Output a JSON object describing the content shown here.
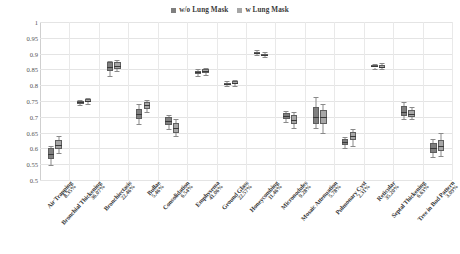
{
  "legend": {
    "position": "top-center",
    "entries": [
      {
        "label": "w/o Lung Mask",
        "color": "#7f7f7f"
      },
      {
        "label": "w Lung Mask",
        "color": "#a6a6a6"
      }
    ]
  },
  "axes": {
    "y": {
      "min": 0.5,
      "max": 1.0,
      "step": 0.05,
      "ticks": [
        "0.5",
        "0.55",
        "0.6",
        "0.65",
        "0.7",
        "0.75",
        "0.8",
        "0.85",
        "0.9",
        "0.95",
        "1"
      ],
      "label": "",
      "grid": true
    },
    "x": {
      "label": "",
      "grid": true
    }
  },
  "chart_data": {
    "type": "box",
    "title": "",
    "xlabel": "",
    "ylabel": "",
    "ylim": [
      0.5,
      1.0
    ],
    "ytick_step": 0.05,
    "grid": true,
    "legend_position": "top-center",
    "categories": [
      "Air Trapping",
      "Bronchial Thickening",
      "Bronchiectasis",
      "Bullae",
      "Consolidation",
      "Emphysema",
      "Ground Glass",
      "Honeycombing",
      "Micronodules",
      "Mosaic Attenuation",
      "Pulmonary Cyst",
      "Reticular",
      "Septal Thickening",
      "Tree in Bud Pattern"
    ],
    "category_percentages": [
      "8.35%",
      "36.07%",
      "22.46%",
      "5.46%",
      "6.54%",
      "41.06%",
      "22.57%",
      "11.46%",
      "9.28%",
      "5.78%",
      "2.31%",
      "35.20%",
      "6.63%",
      "3.09%"
    ],
    "series": [
      {
        "name": "w/o Lung Mask",
        "color": "#7f7f7f",
        "boxes": [
          {
            "category": "Air Trapping",
            "whisker_low": 0.548,
            "q1": 0.565,
            "median": 0.582,
            "q3": 0.6,
            "whisker_high": 0.607
          },
          {
            "category": "Bronchial Thickening",
            "whisker_low": 0.738,
            "q1": 0.742,
            "median": 0.746,
            "q3": 0.75,
            "whisker_high": 0.752
          },
          {
            "category": "Bronchiectasis",
            "whisker_low": 0.828,
            "q1": 0.845,
            "median": 0.858,
            "q3": 0.872,
            "whisker_high": 0.878
          },
          {
            "category": "Bullae",
            "whisker_low": 0.676,
            "q1": 0.694,
            "median": 0.71,
            "q3": 0.726,
            "whisker_high": 0.742
          },
          {
            "category": "Consolidation",
            "whisker_low": 0.66,
            "q1": 0.674,
            "median": 0.686,
            "q3": 0.698,
            "whisker_high": 0.706
          },
          {
            "category": "Emphysema",
            "whisker_low": 0.828,
            "q1": 0.836,
            "median": 0.841,
            "q3": 0.846,
            "whisker_high": 0.852
          },
          {
            "category": "Ground Glass",
            "whisker_low": 0.798,
            "q1": 0.801,
            "median": 0.804,
            "q3": 0.808,
            "whisker_high": 0.812
          },
          {
            "category": "Honeycombing",
            "whisker_low": 0.894,
            "q1": 0.898,
            "median": 0.902,
            "q3": 0.906,
            "whisker_high": 0.91
          },
          {
            "category": "Micronodules",
            "whisker_low": 0.684,
            "q1": 0.694,
            "median": 0.703,
            "q3": 0.712,
            "whisker_high": 0.718
          },
          {
            "category": "Mosaic Attenuation",
            "whisker_low": 0.664,
            "q1": 0.676,
            "median": 0.7,
            "q3": 0.73,
            "whisker_high": 0.762
          },
          {
            "category": "Pulmonary Cyst",
            "whisker_low": 0.602,
            "q1": 0.612,
            "median": 0.621,
            "q3": 0.63,
            "whisker_high": 0.636
          },
          {
            "category": "Reticular",
            "whisker_low": 0.85,
            "q1": 0.856,
            "median": 0.86,
            "q3": 0.864,
            "whisker_high": 0.868
          },
          {
            "category": "Septal Thickening",
            "whisker_low": 0.694,
            "q1": 0.702,
            "median": 0.716,
            "q3": 0.734,
            "whisker_high": 0.748
          },
          {
            "category": "Tree in Bud Pattern",
            "whisker_low": 0.572,
            "q1": 0.586,
            "median": 0.6,
            "q3": 0.616,
            "whisker_high": 0.63
          }
        ]
      },
      {
        "name": "w Lung Mask",
        "color": "#a6a6a6",
        "boxes": [
          {
            "category": "Air Trapping",
            "whisker_low": 0.584,
            "q1": 0.598,
            "median": 0.612,
            "q3": 0.626,
            "whisker_high": 0.638
          },
          {
            "category": "Bronchial Thickening",
            "whisker_low": 0.74,
            "q1": 0.746,
            "median": 0.751,
            "q3": 0.756,
            "whisker_high": 0.76
          },
          {
            "category": "Bronchiectasis",
            "whisker_low": 0.844,
            "q1": 0.852,
            "median": 0.862,
            "q3": 0.872,
            "whisker_high": 0.88
          },
          {
            "category": "Bullae",
            "whisker_low": 0.716,
            "q1": 0.726,
            "median": 0.736,
            "q3": 0.746,
            "whisker_high": 0.754
          },
          {
            "category": "Consolidation",
            "whisker_low": 0.638,
            "q1": 0.65,
            "median": 0.664,
            "q3": 0.68,
            "whisker_high": 0.692
          },
          {
            "category": "Emphysema",
            "whisker_low": 0.832,
            "q1": 0.838,
            "median": 0.844,
            "q3": 0.85,
            "whisker_high": 0.856
          },
          {
            "category": "Ground Glass",
            "whisker_low": 0.798,
            "q1": 0.803,
            "median": 0.808,
            "q3": 0.813,
            "whisker_high": 0.818
          },
          {
            "category": "Honeycombing",
            "whisker_low": 0.888,
            "q1": 0.892,
            "median": 0.896,
            "q3": 0.9,
            "whisker_high": 0.904
          },
          {
            "category": "Micronodules",
            "whisker_low": 0.664,
            "q1": 0.676,
            "median": 0.69,
            "q3": 0.706,
            "whisker_high": 0.716
          },
          {
            "category": "Mosaic Attenuation",
            "whisker_low": 0.65,
            "q1": 0.678,
            "median": 0.7,
            "q3": 0.722,
            "whisker_high": 0.74
          },
          {
            "category": "Pulmonary Cyst",
            "whisker_low": 0.608,
            "q1": 0.626,
            "median": 0.64,
            "q3": 0.652,
            "whisker_high": 0.662
          },
          {
            "category": "Reticular",
            "whisker_low": 0.85,
            "q1": 0.855,
            "median": 0.859,
            "q3": 0.864,
            "whisker_high": 0.87
          },
          {
            "category": "Septal Thickening",
            "whisker_low": 0.692,
            "q1": 0.7,
            "median": 0.71,
            "q3": 0.722,
            "whisker_high": 0.732
          },
          {
            "category": "Tree in Bud Pattern",
            "whisker_low": 0.576,
            "q1": 0.592,
            "median": 0.608,
            "q3": 0.628,
            "whisker_high": 0.648
          }
        ]
      }
    ]
  }
}
